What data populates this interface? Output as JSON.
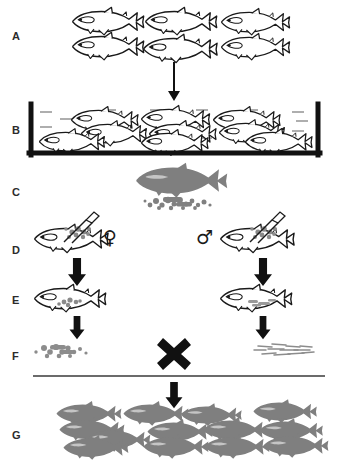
{
  "figure": {
    "background_color": "#ffffff",
    "outline_color": "#1a1a1a",
    "gray_fill": "#7f7f7f",
    "label_color": "#2b2b2b"
  },
  "panels": [
    {
      "id": "A",
      "label": "A",
      "caption": "Recipient host fish stock",
      "label_x": 12,
      "label_y": 37,
      "fish_count": 6,
      "fish_style": "outline"
    },
    {
      "id": "B",
      "label": "B",
      "caption": "Host fish held in tank",
      "label_x": 12,
      "label_y": 131,
      "fish_count": 9,
      "fish_style": "outline"
    },
    {
      "id": "C",
      "label": "C",
      "caption": "Donor fish and isolated germ cells",
      "label_x": 12,
      "label_y": 193,
      "fish_count": 1,
      "fish_style": "gray"
    },
    {
      "id": "D",
      "label": "D",
      "caption": "Germ cells transplanted into recipient larvae",
      "label_x": 12,
      "label_y": 251,
      "fish_count": 2,
      "fish_style": "outline-injected"
    },
    {
      "id": "E",
      "label": "E",
      "caption": "Matured surrogate broodstock",
      "label_x": 12,
      "label_y": 301,
      "fish_count": 2,
      "fish_style": "outline-gonad"
    },
    {
      "id": "F",
      "label": "F",
      "caption": "Donor-derived eggs crossed with donor-derived sperm",
      "label_x": 12,
      "label_y": 357,
      "fish_count": 0,
      "fish_style": "gametes"
    },
    {
      "id": "G",
      "label": "G",
      "caption": "Donor-derived offspring",
      "label_x": 12,
      "label_y": 436,
      "fish_count": 12,
      "fish_style": "gray"
    }
  ],
  "symbols": {
    "female": "♀",
    "male": "♂",
    "cross": "×",
    "female_label": "female-sex-symbol",
    "male_label": "male-sex-symbol",
    "cross_label": "cross-fertilization-symbol"
  },
  "arrows": [
    {
      "name": "arrow-a-to-b",
      "style": "thin",
      "x": 174,
      "y1": 62,
      "y2": 100
    },
    {
      "name": "arrow-d-to-e-female",
      "style": "thick",
      "x": 77,
      "y1": 256,
      "y2": 292
    },
    {
      "name": "arrow-d-to-e-male",
      "style": "thick",
      "x": 263,
      "y1": 256,
      "y2": 292
    },
    {
      "name": "arrow-e-to-f-female",
      "style": "thick",
      "x": 77,
      "y1": 312,
      "y2": 340
    },
    {
      "name": "arrow-e-to-f-male",
      "style": "thick",
      "x": 263,
      "y1": 312,
      "y2": 340
    },
    {
      "name": "arrow-f-to-g",
      "style": "thick",
      "x": 174,
      "y1": 384,
      "y2": 408
    }
  ],
  "tank": {
    "name": "holding-tank",
    "x": 28,
    "y": 104,
    "width": 293,
    "height": 51,
    "wall_color": "#111111",
    "water_dash_color": "#9a9a9a",
    "water_dash_count": 14
  },
  "gamete_groups": [
    {
      "name": "egg-cluster-panel-c",
      "type": "eggs",
      "x": 150,
      "y": 198,
      "count": 18
    },
    {
      "name": "egg-cluster-panel-f",
      "type": "eggs",
      "x": 48,
      "y": 348,
      "count": 18
    },
    {
      "name": "sperm-cluster-panel-f",
      "type": "sperm",
      "x": 272,
      "y": 350,
      "count": 22
    }
  ],
  "divider": {
    "name": "horizontal-divider",
    "x1": 33,
    "x2": 325,
    "y": 375,
    "color": "#3a3a3a"
  }
}
